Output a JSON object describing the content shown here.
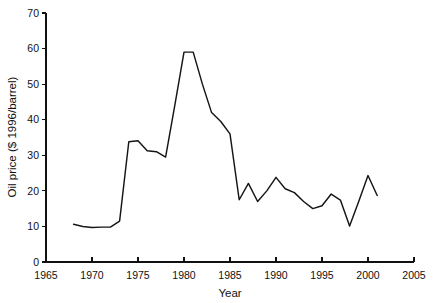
{
  "chart_data": {
    "type": "line",
    "title": "",
    "xlabel": "Year",
    "ylabel": "Oil price ($ 1996/barrel)",
    "xlim": [
      1965,
      2005
    ],
    "ylim": [
      0,
      70
    ],
    "xticks": [
      1965,
      1970,
      1975,
      1980,
      1985,
      1990,
      1995,
      2000,
      2005
    ],
    "xtick_labels": [
      "1965",
      "1970",
      "1975",
      "1980",
      "1985",
      "1990",
      "1995",
      "2000",
      "2005"
    ],
    "yticks": [
      0,
      10,
      20,
      30,
      40,
      50,
      60,
      70
    ],
    "ytick_labels": [
      "0",
      "10",
      "20",
      "30",
      "40",
      "50",
      "60",
      "70"
    ],
    "grid": false,
    "legend": false,
    "legend_position": "none",
    "line_color": "#151515",
    "series": [
      {
        "name": "Oil price",
        "x": [
          1968,
          1969,
          1970,
          1971,
          1972,
          1973,
          1974,
          1975,
          1976,
          1977,
          1978,
          1979,
          1980,
          1981,
          1982,
          1983,
          1984,
          1985,
          1986,
          1987,
          1988,
          1989,
          1990,
          1991,
          1992,
          1993,
          1994,
          1995,
          1996,
          1997,
          1998,
          1999,
          2000,
          2001
        ],
        "values": [
          10.6,
          10.0,
          9.7,
          9.8,
          9.8,
          11.5,
          33.8,
          34.1,
          31.3,
          31.0,
          29.5,
          44.0,
          59.0,
          59.0,
          50.0,
          42.0,
          39.5,
          36.0,
          17.5,
          22.1,
          17.0,
          20.0,
          23.8,
          20.6,
          19.5,
          17.0,
          15.0,
          15.8,
          19.1,
          17.4,
          10.1,
          17.1,
          24.3,
          18.7
        ]
      }
    ]
  },
  "axes": {
    "y_axis_label": "Oil price ($ 1996/barrel)",
    "x_axis_label": "Year"
  }
}
